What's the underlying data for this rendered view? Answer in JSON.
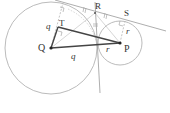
{
  "diagram": {
    "type": "geometry-two-tangent-circles",
    "points": {
      "Q": {
        "label": "Q",
        "x": 51,
        "y": 48
      },
      "P": {
        "label": "P",
        "x": 120,
        "y": 43
      },
      "R": {
        "label": "R",
        "x": 95,
        "y": 13
      },
      "S": {
        "label": "S",
        "x": 123,
        "y": 21
      },
      "T": {
        "label": "T",
        "x": 58,
        "y": 27
      }
    },
    "labels": {
      "Q": "Q",
      "P": "P",
      "R": "R",
      "S": "S",
      "T": "T",
      "q_top": "q",
      "q_bottom": "q",
      "r_right": "r",
      "r_bottom": "r"
    },
    "circles": [
      {
        "name": "circle-Q",
        "cx": 51,
        "cy": 48,
        "r": 46
      },
      {
        "name": "circle-P",
        "cx": 120,
        "cy": 43,
        "r": 22
      }
    ],
    "colors": {
      "thin_line": "#aaaaaa",
      "thick_line": "#444444",
      "point": "#222222"
    }
  }
}
